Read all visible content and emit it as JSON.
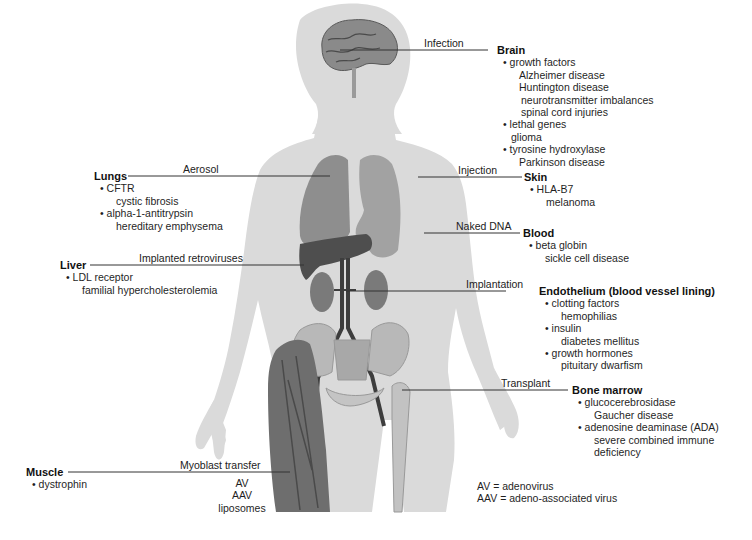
{
  "figure": {
    "colors": {
      "silhouette": "#d9d9d9",
      "organ": "#8c8c8c",
      "organ_dark": "#4a4a4a",
      "muscle": "#6f6f6f",
      "bone": "#bdbdbd",
      "leader_line": "#333333"
    }
  },
  "annotations": {
    "brain": {
      "route": "Infection",
      "title": "Brain",
      "items": [
        {
          "gene": "• growth factors",
          "diseases": [
            "Alzheimer disease",
            "Huntington disease",
            "neurotransmitter imbalances",
            "spinal cord injuries"
          ]
        },
        {
          "gene": "• lethal genes",
          "diseases": [
            "glioma"
          ]
        },
        {
          "gene": "• tyrosine hydroxylase",
          "diseases": [
            "Parkinson disease"
          ]
        }
      ]
    },
    "lungs": {
      "route": "Aerosol",
      "title": "Lungs",
      "items": [
        {
          "gene": "• CFTR",
          "diseases": [
            "cystic fibrosis"
          ]
        },
        {
          "gene": "• alpha-1-antitrypsin",
          "diseases": [
            "hereditary emphysema"
          ]
        }
      ]
    },
    "skin": {
      "route": "Injection",
      "title": "Skin",
      "items": [
        {
          "gene": "• HLA-B7",
          "diseases": [
            "melanoma"
          ]
        }
      ]
    },
    "blood": {
      "route": "Naked DNA",
      "title": "Blood",
      "items": [
        {
          "gene": "• beta globin",
          "diseases": [
            "sickle cell disease"
          ]
        }
      ]
    },
    "liver": {
      "route": "Implanted retroviruses",
      "title": "Liver",
      "items": [
        {
          "gene": "• LDL receptor",
          "diseases": [
            "familial hypercholesterolemia"
          ]
        }
      ]
    },
    "endothelium": {
      "route": "Implantation",
      "title": "Endothelium (blood vessel lining)",
      "items": [
        {
          "gene": "• clotting factors",
          "diseases": [
            "hemophilias"
          ]
        },
        {
          "gene": "• insulin",
          "diseases": [
            "diabetes mellitus"
          ]
        },
        {
          "gene": "• growth hormones",
          "diseases": [
            "pituitary dwarfism"
          ]
        }
      ]
    },
    "bone_marrow": {
      "route": "Transplant",
      "title": "Bone marrow",
      "items": [
        {
          "gene": "• glucocerebrosidase",
          "diseases": [
            "Gaucher disease"
          ]
        },
        {
          "gene": "• adenosine deaminase (ADA)",
          "diseases": [
            "severe combined immune",
            "deficiency"
          ]
        }
      ]
    },
    "muscle": {
      "route": "Myoblast transfer",
      "title": "Muscle",
      "items": [
        {
          "gene": "• dystrophin",
          "diseases": []
        }
      ]
    }
  },
  "vectors": [
    "AV",
    "AAV",
    "liposomes"
  ],
  "legend": {
    "lines": [
      "AV = adenovirus",
      "AAV = adeno-associated virus"
    ]
  }
}
